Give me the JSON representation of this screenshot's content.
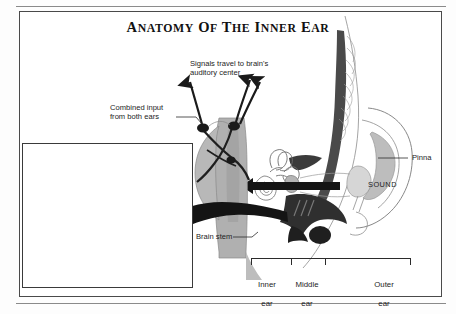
{
  "document": {
    "title_full": "ANATOMY OF THE INNER EAR",
    "title_parts": {
      "a": "A",
      "natomy": "NATOMY",
      "o": "O",
      "f": "F",
      "t": "T",
      "he": "HE",
      "i": "I",
      "nner": "NNER",
      "e": "E",
      "ar": "AR"
    }
  },
  "diagram": {
    "callouts": {
      "signals": "Signals travel to brain's\nauditory center",
      "combined": "Combined input\nfrom both ears",
      "brain_stem": "Brain stem",
      "pinna": "Pinna",
      "sound": "SOUND"
    },
    "inset_labels": {
      "cochlea": "Cochlea",
      "auditory_nerve": "Auditory\nnerve",
      "semicircular_canals": "Semicircular\ncanals",
      "incus": "Incus",
      "malleus": "Malleus",
      "eustachian_tube": "Eustachian\ntube",
      "stapes": "Stapes",
      "eardrum": "Eardrum"
    },
    "regions": [
      {
        "name": "inner-ear",
        "line1": "Inner",
        "line2": "ear"
      },
      {
        "name": "middle-ear",
        "line1": "Middle",
        "line2": "ear"
      },
      {
        "name": "outer-ear",
        "line1": "Outer",
        "line2": "ear"
      }
    ],
    "colors": {
      "ink": "#1d1d1d",
      "frame": "#4a4a4a",
      "tissue_gray": "#a8a8a8",
      "tissue_light": "#c9c9c9",
      "tissue_mid": "#8f8f8f",
      "nerve_dark": "#1a1a1a",
      "page": "#ffffff"
    }
  }
}
